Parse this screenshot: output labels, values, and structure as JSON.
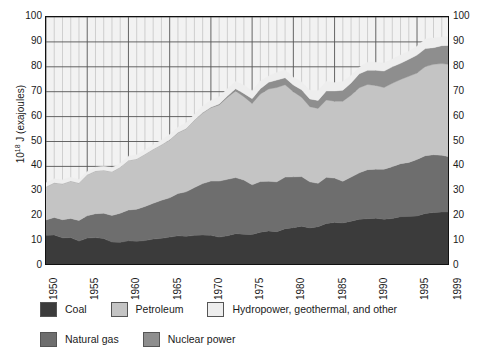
{
  "chart_data": {
    "type": "area",
    "stacked": true,
    "title": "",
    "xlabel": "",
    "ylabel": "10^18 J (exajoules)",
    "ylabel_prefix": "10",
    "ylabel_exponent": "18",
    "ylabel_suffix": " J (exajoules)",
    "xlim": [
      1950,
      1999
    ],
    "ylim": [
      0,
      100
    ],
    "ytick_step": 10,
    "grid": "both",
    "grid_minor_x": "every year",
    "grid_major_x": "every 5 years",
    "legend_position": "below-left",
    "yticks": [
      0,
      10,
      20,
      30,
      40,
      50,
      60,
      70,
      80,
      90,
      100
    ],
    "yticks_right": [
      0,
      10,
      20,
      30,
      40,
      50,
      60,
      70,
      80,
      90,
      100
    ],
    "xticks": [
      1950,
      1955,
      1960,
      1965,
      1970,
      1975,
      1980,
      1985,
      1990,
      1995,
      1999
    ],
    "x": [
      1950,
      1951,
      1952,
      1953,
      1954,
      1955,
      1956,
      1957,
      1958,
      1959,
      1960,
      1961,
      1962,
      1963,
      1964,
      1965,
      1966,
      1967,
      1968,
      1969,
      1970,
      1971,
      1972,
      1973,
      1974,
      1975,
      1976,
      1977,
      1978,
      1979,
      1980,
      1981,
      1982,
      1983,
      1984,
      1985,
      1986,
      1987,
      1988,
      1989,
      1990,
      1991,
      1992,
      1993,
      1994,
      1995,
      1996,
      1997,
      1998,
      1999
    ],
    "series": [
      {
        "name": "Coal",
        "color": "#3b3b3b",
        "values": [
          12.3,
          12.5,
          11.3,
          11.4,
          10.0,
          11.2,
          11.4,
          11.0,
          9.6,
          9.5,
          10.1,
          9.9,
          10.2,
          10.8,
          11.1,
          11.6,
          12.1,
          11.9,
          12.3,
          12.4,
          12.3,
          11.6,
          12.1,
          13.0,
          12.8,
          12.7,
          13.6,
          14.1,
          13.8,
          15.0,
          15.4,
          16.0,
          15.3,
          15.8,
          17.1,
          17.5,
          17.3,
          18.0,
          18.8,
          19.0,
          19.2,
          18.8,
          19.1,
          19.8,
          19.9,
          20.1,
          21.1,
          21.5,
          21.7,
          21.7
        ]
      },
      {
        "name": "Natural gas",
        "color": "#6e6e6e",
        "values": [
          6.2,
          7.0,
          7.3,
          7.7,
          8.3,
          9.0,
          9.6,
          10.2,
          10.7,
          11.7,
          12.4,
          12.9,
          13.7,
          14.4,
          15.3,
          15.8,
          17.0,
          17.9,
          19.2,
          20.7,
          21.8,
          22.5,
          22.7,
          22.5,
          21.7,
          19.9,
          20.3,
          19.9,
          20.0,
          20.7,
          20.4,
          19.9,
          18.5,
          17.4,
          18.5,
          17.8,
          16.7,
          17.7,
          18.6,
          19.7,
          19.7,
          20.1,
          20.8,
          21.3,
          21.7,
          22.7,
          23.2,
          23.2,
          22.8,
          22.1
        ]
      },
      {
        "name": "Petroleum",
        "color": "#c4c4c4",
        "values": [
          13.3,
          13.9,
          14.4,
          15.0,
          15.0,
          16.4,
          17.2,
          17.3,
          17.6,
          18.5,
          19.9,
          20.2,
          21.0,
          21.7,
          22.3,
          23.2,
          24.4,
          25.3,
          27.0,
          28.3,
          29.5,
          30.6,
          32.9,
          34.8,
          33.5,
          32.7,
          35.2,
          37.1,
          37.9,
          37.1,
          34.2,
          31.9,
          30.2,
          30.1,
          31.1,
          30.9,
          32.2,
          32.9,
          34.2,
          34.2,
          33.6,
          32.8,
          33.5,
          33.8,
          34.6,
          34.7,
          35.8,
          36.3,
          36.8,
          37.1
        ]
      },
      {
        "name": "Nuclear power",
        "color": "#8e8e8e",
        "values": [
          0.0,
          0.0,
          0.0,
          0.0,
          0.0,
          0.0,
          0.0,
          0.0,
          0.0,
          0.0,
          0.0,
          0.0,
          0.0,
          0.0,
          0.0,
          0.1,
          0.1,
          0.1,
          0.1,
          0.2,
          0.2,
          0.4,
          0.6,
          0.9,
          1.3,
          1.9,
          2.1,
          2.7,
          3.0,
          2.8,
          2.7,
          3.0,
          3.1,
          3.2,
          3.6,
          4.1,
          4.4,
          4.9,
          5.6,
          5.7,
          6.1,
          6.6,
          6.6,
          6.5,
          6.8,
          7.2,
          7.2,
          6.7,
          7.2,
          7.7
        ]
      },
      {
        "name": "Hydropower, geothermal, and other",
        "color": "#eeeeee",
        "values": [
          1.6,
          1.6,
          1.6,
          1.5,
          1.4,
          1.4,
          1.5,
          1.6,
          1.6,
          1.6,
          1.7,
          1.7,
          1.8,
          1.8,
          1.9,
          2.1,
          2.1,
          2.3,
          2.3,
          2.7,
          2.7,
          2.9,
          2.9,
          2.9,
          3.3,
          3.2,
          3.1,
          2.5,
          3.0,
          3.1,
          3.1,
          3.1,
          3.5,
          3.9,
          3.8,
          3.4,
          3.5,
          3.0,
          2.6,
          3.2,
          3.2,
          3.2,
          3.1,
          3.3,
          3.2,
          3.6,
          3.9,
          3.9,
          3.5,
          3.5
        ]
      }
    ],
    "totals_note": "stacked order bottom to top: Coal, Natural gas, Petroleum, Nuclear power, Hydropower geothermal and other"
  },
  "legend": {
    "row1": [
      {
        "label": "Coal",
        "color": "#3b3b3b"
      },
      {
        "label": "Petroleum",
        "color": "#c4c4c4"
      },
      {
        "label": "Hydropower, geothermal, and other",
        "color": "#eeeeee"
      }
    ],
    "row2": [
      {
        "label": "Natural gas",
        "color": "#6e6e6e"
      },
      {
        "label": "Nuclear power",
        "color": "#8e8e8e"
      }
    ]
  },
  "colors": {
    "coal": "#3b3b3b",
    "natural_gas": "#6e6e6e",
    "petroleum": "#c4c4c4",
    "nuclear": "#8e8e8e",
    "hydro_other": "#eeeeee",
    "grid_minor": "#aaaaaa",
    "grid_major": "#555555",
    "axis": "#111111",
    "background": "#ffffff",
    "plot_background": "#f2f2f2"
  }
}
